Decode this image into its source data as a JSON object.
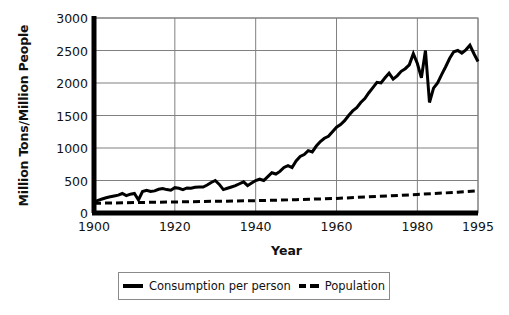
{
  "chart_data": {
    "type": "line",
    "title": "",
    "xlabel": "Year",
    "ylabel": "Million Tons/Million People",
    "xlim": [
      1900,
      1995
    ],
    "ylim": [
      0,
      3000
    ],
    "xticks": [
      1900,
      1920,
      1940,
      1960,
      1980,
      1995
    ],
    "yticks": [
      0,
      500,
      1000,
      1500,
      2000,
      2500,
      3000
    ],
    "grid": "horizontal-and-vertical",
    "legend_position": "bottom-center",
    "series": [
      {
        "name": "Consumption per person",
        "style": "solid",
        "color": "#000000",
        "x": [
          1900,
          1901,
          1902,
          1903,
          1904,
          1905,
          1906,
          1907,
          1908,
          1909,
          1910,
          1911,
          1912,
          1913,
          1914,
          1915,
          1916,
          1917,
          1918,
          1919,
          1920,
          1921,
          1922,
          1923,
          1924,
          1925,
          1926,
          1927,
          1928,
          1929,
          1930,
          1931,
          1932,
          1933,
          1934,
          1935,
          1936,
          1937,
          1938,
          1939,
          1940,
          1941,
          1942,
          1943,
          1944,
          1945,
          1946,
          1947,
          1948,
          1949,
          1950,
          1951,
          1952,
          1953,
          1954,
          1955,
          1956,
          1957,
          1958,
          1959,
          1960,
          1961,
          1962,
          1963,
          1964,
          1965,
          1966,
          1967,
          1968,
          1969,
          1970,
          1971,
          1972,
          1973,
          1974,
          1975,
          1976,
          1977,
          1978,
          1979,
          1980,
          1981,
          1982,
          1983,
          1984,
          1985,
          1986,
          1987,
          1988,
          1989,
          1990,
          1991,
          1992,
          1993,
          1994,
          1995
        ],
        "values": [
          170,
          195,
          215,
          235,
          250,
          262,
          275,
          300,
          268,
          290,
          300,
          200,
          330,
          350,
          330,
          340,
          365,
          375,
          360,
          350,
          390,
          380,
          360,
          385,
          380,
          395,
          400,
          400,
          430,
          470,
          500,
          440,
          360,
          380,
          400,
          420,
          450,
          480,
          420,
          460,
          500,
          520,
          500,
          560,
          620,
          600,
          640,
          700,
          730,
          700,
          800,
          870,
          900,
          960,
          940,
          1030,
          1100,
          1150,
          1180,
          1250,
          1320,
          1360,
          1420,
          1500,
          1570,
          1620,
          1700,
          1760,
          1850,
          1930,
          2010,
          2000,
          2080,
          2150,
          2060,
          2110,
          2180,
          2220,
          2280,
          2450,
          2300,
          2080,
          2500,
          1700,
          1920,
          2000,
          2130,
          2250,
          2380,
          2480,
          2500,
          2460,
          2510,
          2580,
          2450,
          2330
        ]
      },
      {
        "name": "Population",
        "style": "dashed",
        "color": "#000000",
        "x": [
          1900,
          1910,
          1920,
          1930,
          1940,
          1950,
          1960,
          1970,
          1980,
          1990,
          1995
        ],
        "values": [
          150,
          160,
          170,
          180,
          190,
          205,
          225,
          255,
          285,
          320,
          340
        ]
      }
    ]
  },
  "axis": {
    "y_title": "Million Tons/Million People",
    "x_title": "Year",
    "y_tick_labels": [
      "3000",
      "2500",
      "2000",
      "1500",
      "1000",
      "500",
      "0"
    ],
    "x_tick_labels": [
      "1900",
      "1920",
      "1940",
      "1960",
      "1980",
      "1995"
    ]
  },
  "legend": {
    "items": [
      {
        "label": "Consumption per person",
        "marker": "solid-line-swatch"
      },
      {
        "label": "Population",
        "marker": "dashed-line-swatch"
      }
    ]
  },
  "colors": {
    "line": "#000000",
    "grid": "#808080",
    "axis": "#000000",
    "background": "#ffffff"
  }
}
